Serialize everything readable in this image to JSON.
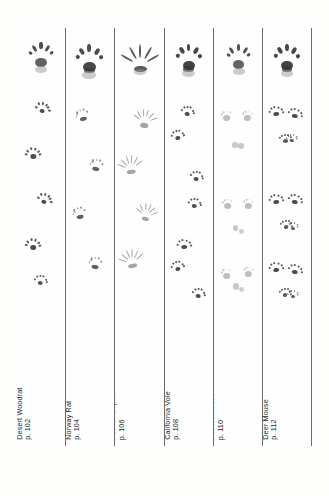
{
  "page": {
    "kind": "field-guide-track-plate",
    "background_color": "#fdfdfc",
    "ink_color": "#2e2e2e",
    "rule_color": "#6b6b6b"
  },
  "columns": [
    {
      "id": "desert-woodrat",
      "name": "Desert Woodrat",
      "page_ref": "p. 102",
      "label_lines": [
        "Desert Woodrat",
        "p. 102"
      ],
      "track_description": "single-file alternating star-shaped prints, large splayed front print at top",
      "prints": [
        {
          "x": 50,
          "y": 14,
          "size": 30,
          "rot": 0,
          "style": "splayed-five",
          "ink": "#3b3b3b"
        },
        {
          "x": 52,
          "y": 72,
          "size": 17,
          "rot": 10,
          "style": "star",
          "ink": "#3b3b3b"
        },
        {
          "x": 33,
          "y": 117,
          "size": 18,
          "rot": -8,
          "style": "star",
          "ink": "#3b3b3b"
        },
        {
          "x": 58,
          "y": 163,
          "size": 17,
          "rot": 14,
          "style": "star",
          "ink": "#3b3b3b"
        },
        {
          "x": 34,
          "y": 208,
          "size": 18,
          "rot": -5,
          "style": "star",
          "ink": "#3b3b3b"
        },
        {
          "x": 48,
          "y": 245,
          "size": 15,
          "rot": 6,
          "style": "star",
          "ink": "#454545"
        }
      ]
    },
    {
      "id": "norway-rat",
      "name": "Norway Rat",
      "page_ref": "p. 104",
      "label_lines": [
        "Norway Rat",
        "p. 104"
      ],
      "track_description": "large five-toed fore print at top, then paired fore/hind groupings zig-zagging",
      "prints": [
        {
          "x": 48,
          "y": 16,
          "size": 34,
          "rot": 0,
          "style": "splayed-five-heavy",
          "ink": "#3a3a3a"
        },
        {
          "x": 33,
          "y": 80,
          "size": 15,
          "rot": -15,
          "style": "cluster-pair",
          "ink": "#4a4a4a"
        },
        {
          "x": 62,
          "y": 130,
          "size": 15,
          "rot": 12,
          "style": "cluster-pair",
          "ink": "#4a4a4a"
        },
        {
          "x": 27,
          "y": 178,
          "size": 15,
          "rot": -10,
          "style": "cluster-pair",
          "ink": "#4a4a4a"
        },
        {
          "x": 60,
          "y": 228,
          "size": 15,
          "rot": 8,
          "style": "cluster-pair",
          "ink": "#4a4a4a"
        }
      ]
    },
    {
      "id": "bottas-pocket-gopher",
      "name": "Botta's Pocket Gopher",
      "page_ref": "p. 106",
      "label_lines": [
        "Botta's",
        "Pocket Gopher",
        "p. 106"
      ],
      "track_description": "long-clawed raking fore prints, claw marks dominant, alternating",
      "prints": [
        {
          "x": 52,
          "y": 18,
          "size": 30,
          "rot": 0,
          "style": "claw-rake-big",
          "ink": "#3c3c3c"
        },
        {
          "x": 62,
          "y": 82,
          "size": 20,
          "rot": 8,
          "style": "claw-rake",
          "ink": "#5a5a5a"
        },
        {
          "x": 32,
          "y": 128,
          "size": 21,
          "rot": -8,
          "style": "claw-rake",
          "ink": "#5a5a5a"
        },
        {
          "x": 64,
          "y": 176,
          "size": 19,
          "rot": 12,
          "style": "claw-rake",
          "ink": "#5a5a5a"
        },
        {
          "x": 34,
          "y": 222,
          "size": 21,
          "rot": -12,
          "style": "claw-rake",
          "ink": "#5a5a5a"
        }
      ]
    },
    {
      "id": "california-vole",
      "name": "California Vole",
      "page_ref": "p. 108",
      "label_lines": [
        "California Vole",
        "p. 108"
      ],
      "track_description": "dark compact prints, alternating left-right pairs down the column",
      "prints": [
        {
          "x": 50,
          "y": 16,
          "size": 32,
          "rot": 0,
          "style": "splayed-five-dark",
          "ink": "#333"
        },
        {
          "x": 47,
          "y": 76,
          "size": 15,
          "rot": 8,
          "style": "star",
          "ink": "#3a3a3a"
        },
        {
          "x": 27,
          "y": 100,
          "size": 15,
          "rot": -8,
          "style": "star",
          "ink": "#3a3a3a"
        },
        {
          "x": 66,
          "y": 141,
          "size": 15,
          "rot": 10,
          "style": "star",
          "ink": "#3a3a3a"
        },
        {
          "x": 62,
          "y": 168,
          "size": 15,
          "rot": 6,
          "style": "star",
          "ink": "#3a3a3a"
        },
        {
          "x": 40,
          "y": 209,
          "size": 16,
          "rot": -6,
          "style": "star",
          "ink": "#3a3a3a"
        },
        {
          "x": 26,
          "y": 231,
          "size": 15,
          "rot": -10,
          "style": "star",
          "ink": "#3a3a3a"
        },
        {
          "x": 70,
          "y": 258,
          "size": 15,
          "rot": 8,
          "style": "star",
          "ink": "#3a3a3a"
        }
      ]
    },
    {
      "id": "california-pocket-mouse",
      "name": "California Pocket Mouse",
      "page_ref": "p. 110",
      "label_lines": [
        "California",
        "Pocket Mouse",
        "p. 110"
      ],
      "track_description": "bounding pattern, faint paired hind prints with small fore prints between",
      "prints": [
        {
          "x": 52,
          "y": 16,
          "size": 30,
          "rot": 0,
          "style": "hand-five",
          "ink": "#3d3d3d"
        },
        {
          "x": 26,
          "y": 82,
          "size": 13,
          "rot": -6,
          "style": "faint-pad",
          "ink": "#8a8a8a"
        },
        {
          "x": 70,
          "y": 82,
          "size": 13,
          "rot": 6,
          "style": "faint-pad",
          "ink": "#8a8a8a"
        },
        {
          "x": 44,
          "y": 113,
          "size": 8,
          "rot": 0,
          "style": "dot",
          "ink": "#9a9a9a"
        },
        {
          "x": 57,
          "y": 114,
          "size": 8,
          "rot": 0,
          "style": "dot",
          "ink": "#9a9a9a"
        },
        {
          "x": 28,
          "y": 170,
          "size": 13,
          "rot": -6,
          "style": "faint-pad",
          "ink": "#8a8a8a"
        },
        {
          "x": 72,
          "y": 170,
          "size": 13,
          "rot": 6,
          "style": "faint-pad",
          "ink": "#8a8a8a"
        },
        {
          "x": 45,
          "y": 196,
          "size": 8,
          "rot": 0,
          "style": "dot",
          "ink": "#9a9a9a"
        },
        {
          "x": 58,
          "y": 200,
          "size": 7,
          "rot": 0,
          "style": "dot",
          "ink": "#a5a5a5"
        },
        {
          "x": 26,
          "y": 240,
          "size": 13,
          "rot": -6,
          "style": "faint-pad",
          "ink": "#8a8a8a"
        },
        {
          "x": 72,
          "y": 238,
          "size": 13,
          "rot": 6,
          "style": "faint-pad",
          "ink": "#8a8a8a"
        },
        {
          "x": 46,
          "y": 254,
          "size": 9,
          "rot": 0,
          "style": "dot",
          "ink": "#9a9a9a"
        },
        {
          "x": 58,
          "y": 258,
          "size": 7,
          "rot": 0,
          "style": "dot",
          "ink": "#a5a5a5"
        }
      ]
    },
    {
      "id": "deer-mouse",
      "name": "Deer Mouse",
      "page_ref": "p. 112",
      "label_lines": [
        "Deer Mouse",
        "p. 112"
      ],
      "track_description": "bounding groups of four: two hind prints above, two smaller fore prints below",
      "prints": [
        {
          "x": 50,
          "y": 16,
          "size": 32,
          "rot": 0,
          "style": "splayed-five-dark",
          "ink": "#333"
        },
        {
          "x": 28,
          "y": 76,
          "size": 16,
          "rot": -8,
          "style": "star",
          "ink": "#3a3a3a"
        },
        {
          "x": 66,
          "y": 78,
          "size": 16,
          "rot": 8,
          "style": "star",
          "ink": "#3a3a3a"
        },
        {
          "x": 47,
          "y": 104,
          "size": 14,
          "rot": 0,
          "style": "star",
          "ink": "#4a4a4a"
        },
        {
          "x": 60,
          "y": 104,
          "size": 13,
          "rot": 0,
          "style": "star",
          "ink": "#4a4a4a"
        },
        {
          "x": 28,
          "y": 164,
          "size": 16,
          "rot": -8,
          "style": "star",
          "ink": "#3a3a3a"
        },
        {
          "x": 66,
          "y": 164,
          "size": 16,
          "rot": 8,
          "style": "star",
          "ink": "#3a3a3a"
        },
        {
          "x": 48,
          "y": 190,
          "size": 14,
          "rot": 0,
          "style": "star",
          "ink": "#4a4a4a"
        },
        {
          "x": 62,
          "y": 192,
          "size": 13,
          "rot": 0,
          "style": "star",
          "ink": "#4a4a4a"
        },
        {
          "x": 28,
          "y": 232,
          "size": 16,
          "rot": -8,
          "style": "star",
          "ink": "#3a3a3a"
        },
        {
          "x": 66,
          "y": 234,
          "size": 16,
          "rot": 8,
          "style": "star",
          "ink": "#3a3a3a"
        },
        {
          "x": 46,
          "y": 258,
          "size": 14,
          "rot": 0,
          "style": "star",
          "ink": "#4a4a4a"
        },
        {
          "x": 62,
          "y": 260,
          "size": 13,
          "rot": 0,
          "style": "star",
          "ink": "#4a4a4a"
        }
      ]
    }
  ]
}
